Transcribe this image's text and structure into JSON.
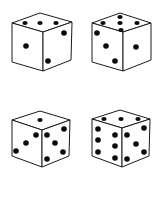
{
  "dice": [
    {
      "id": "die-1",
      "top_face": 3,
      "left_face": 1,
      "right_face": 2
    },
    {
      "id": "die-2",
      "top_face": 5,
      "left_face": 3,
      "right_face": 1
    },
    {
      "id": "die-3",
      "top_face": 1,
      "left_face": 3,
      "right_face": 5
    },
    {
      "id": "die-4",
      "top_face": 3,
      "left_face": 6,
      "right_face": 5
    }
  ],
  "colors": {
    "background": "#ffffff",
    "outline": "#1a1a1a",
    "pip": "#0a0a0a"
  }
}
